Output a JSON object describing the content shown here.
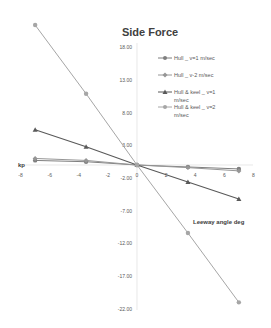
{
  "chart_data": {
    "type": "line",
    "title": "Side Force",
    "xlabel": "Leeway angle deg",
    "ylabel": "kp",
    "xlim": [
      -8,
      8
    ],
    "ylim": [
      -22,
      18
    ],
    "x_ticks": [
      "-8",
      "-6",
      "-4",
      "-2",
      "0",
      "2",
      "4",
      "6",
      "8"
    ],
    "y_ticks": [
      "18.00",
      "13.00",
      "8.00",
      "3.00",
      "-2.00",
      "-7.00",
      "-12.00",
      "-17.00",
      "-22.00"
    ],
    "grid": false,
    "legend_position": "right",
    "x": [
      -7,
      -3.5,
      0,
      3.5,
      7
    ],
    "series": [
      {
        "name": "Hull _ v=1 m/sec",
        "values": [
          0.7,
          0.5,
          0,
          -0.3,
          -0.6
        ],
        "color": "#7f7f7f",
        "marker": "circle"
      },
      {
        "name": "Hull _ v-2 m/sec",
        "values": [
          1.0,
          0.7,
          0,
          -0.4,
          -0.9
        ],
        "color": "#969696",
        "marker": "diamond"
      },
      {
        "name": "Hull & keel _ v=1 m/sec",
        "values": [
          5.4,
          2.8,
          0,
          -2.6,
          -5.2
        ],
        "color": "#595959",
        "marker": "triangle"
      },
      {
        "name": "Hull & keel _ v=2 m/sec",
        "values": [
          21.4,
          10.9,
          0,
          -10.4,
          -21.0
        ],
        "color": "#a6a6a6",
        "marker": "circle"
      }
    ]
  },
  "legend": {
    "items": [
      {
        "label_line1": "Hull _ v=1 m/sec",
        "label_line2": ""
      },
      {
        "label_line1": "Hull _ v-2 m/sec",
        "label_line2": ""
      },
      {
        "label_line1": "Hull & keel _ v=1",
        "label_line2": "m/sec"
      },
      {
        "label_line1": "Hull & keel _ v=2",
        "label_line2": "m/sec"
      }
    ]
  }
}
